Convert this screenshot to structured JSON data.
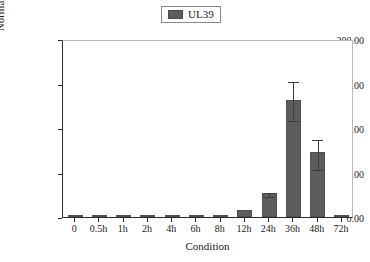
{
  "legend": {
    "entries": [
      {
        "label": "UL39",
        "color": "#5d5d5d",
        "icon": "legend-swatch-icon"
      }
    ]
  },
  "axes": {
    "ylabel": "Normalized Fold Expression",
    "xlabel": "Condition",
    "ytick_labels": [
      "0.00",
      "50.00",
      "100.00",
      "150.00",
      "200.00"
    ]
  },
  "chart_data": {
    "type": "bar",
    "title": "",
    "subtitle": "",
    "xlabel": "Condition",
    "ylabel": "Normalized Fold Expression",
    "ylim": [
      0,
      200
    ],
    "yticks": [
      0,
      50,
      100,
      150,
      200
    ],
    "ytick_labels": [
      "0.00",
      "50.00",
      "100.00",
      "150.00",
      "200.00"
    ],
    "grid": false,
    "legend_position": "top-center",
    "categories": [
      "0",
      "0.5h",
      "1h",
      "2h",
      "4h",
      "6h",
      "8h",
      "12h",
      "24h",
      "36h",
      "48h",
      "72h"
    ],
    "series": [
      {
        "name": "UL39",
        "color": "#5d5d5d",
        "values": [
          0.3,
          0.3,
          0.3,
          0.3,
          0.3,
          0.5,
          2.0,
          8.0,
          27.0,
          132.0,
          73.0,
          0.3
        ],
        "error_upper": [
          0,
          0,
          0,
          0,
          0,
          0,
          0,
          0,
          29.5,
          154.0,
          89.0,
          0
        ],
        "error_lower": [
          0,
          0,
          0,
          0,
          0,
          0,
          0,
          0,
          24.5,
          110.0,
          55.0,
          0
        ]
      }
    ]
  }
}
